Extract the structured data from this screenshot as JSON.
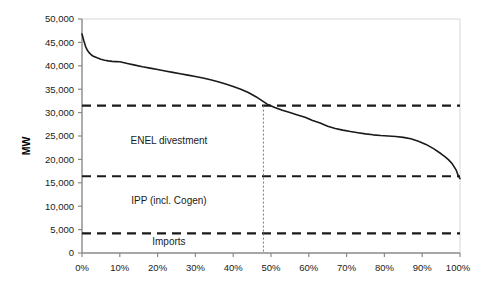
{
  "chart_data": {
    "type": "line",
    "title": "",
    "xlabel": "",
    "ylabel": "MW",
    "xlim": [
      0,
      100
    ],
    "ylim": [
      0,
      50000
    ],
    "grid": false,
    "legend": "none",
    "x_tick_labels": [
      "0%",
      "10%",
      "20%",
      "30%",
      "40%",
      "50%",
      "60%",
      "70%",
      "80%",
      "90%",
      "100%"
    ],
    "x_tick_values": [
      0,
      10,
      20,
      30,
      40,
      50,
      60,
      70,
      80,
      90,
      100
    ],
    "y_tick_labels": [
      "0",
      "5,000",
      "10,000",
      "15,000",
      "20,000",
      "25,000",
      "30,000",
      "35,000",
      "40,000",
      "45,000",
      "50,000"
    ],
    "y_tick_values": [
      0,
      5000,
      10000,
      15000,
      20000,
      25000,
      30000,
      35000,
      40000,
      45000,
      50000
    ],
    "series": [
      {
        "name": "Load duration curve",
        "color": "#1a1a1a",
        "x": [
          0,
          0.5,
          1,
          1.5,
          2,
          2.5,
          3,
          4,
          5,
          6,
          7,
          8,
          9,
          10,
          12,
          14,
          16,
          18,
          20,
          22,
          24,
          26,
          28,
          30,
          32,
          34,
          36,
          38,
          40,
          42,
          44,
          46,
          47.5,
          49,
          51,
          53,
          55,
          57,
          59,
          61,
          63,
          65,
          67,
          69,
          71,
          73,
          75,
          77,
          79,
          81,
          83,
          85,
          87,
          89,
          91,
          93,
          95,
          96,
          97,
          98,
          99,
          99.5,
          100
        ],
        "values": [
          46800,
          45300,
          44000,
          43200,
          42700,
          42300,
          42050,
          41700,
          41400,
          41200,
          41050,
          40950,
          40900,
          40850,
          40500,
          40150,
          39800,
          39500,
          39200,
          38900,
          38600,
          38300,
          38000,
          37700,
          37400,
          37000,
          36600,
          36100,
          35600,
          35000,
          34300,
          33400,
          32600,
          31800,
          31100,
          30500,
          30000,
          29500,
          29000,
          28300,
          27800,
          27100,
          26600,
          26250,
          25950,
          25700,
          25450,
          25250,
          25100,
          25000,
          24900,
          24700,
          24400,
          23900,
          23200,
          22300,
          21200,
          20600,
          19900,
          19000,
          17700,
          16600,
          15900
        ]
      }
    ],
    "reference_lines": [
      {
        "name": "enel-divestment-top",
        "value": 31500,
        "style": "dashed",
        "color": "#1a1a1a"
      },
      {
        "name": "ipp-cogen-top",
        "value": 16400,
        "style": "dashed",
        "color": "#1a1a1a"
      },
      {
        "name": "imports-top",
        "value": 4200,
        "style": "dashed",
        "color": "#1a1a1a"
      }
    ],
    "vertical_marker": {
      "name": "crossing-marker",
      "x": 48,
      "style": "dotted",
      "color": "#7a7a7a"
    },
    "annotations": [
      {
        "name": "enel-divestment-label",
        "text": "ENEL divestment",
        "x": 23,
        "y": 24000
      },
      {
        "name": "ipp-cogen-label",
        "text": "IPP (incl. Cogen)",
        "x": 23,
        "y": 11200
      },
      {
        "name": "imports-label",
        "text": "Imports",
        "x": 23,
        "y": 2400
      }
    ]
  }
}
